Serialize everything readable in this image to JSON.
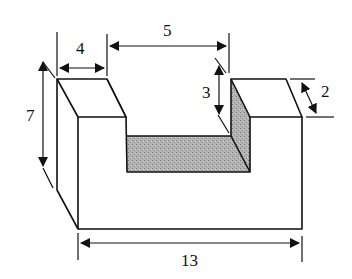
{
  "diagram": {
    "type": "isometric U-channel block with dimensions",
    "colors": {
      "line": "#111111",
      "shade": "#a8a8a8",
      "background": "#ffffff"
    },
    "dimensions": {
      "left_block_width": "4",
      "slot_width": "5",
      "slot_depth": "3",
      "block_depth": "2",
      "height": "7",
      "total_length": "13"
    }
  }
}
